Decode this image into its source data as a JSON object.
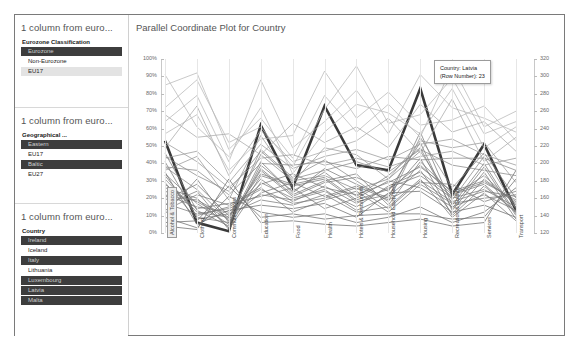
{
  "filters": [
    {
      "title": "1 column from euro...",
      "field": "Eurozone Classification",
      "options": [
        {
          "label": "Eurozone",
          "state": "selected"
        },
        {
          "label": "Non-Eurozone",
          "state": "normal"
        },
        {
          "label": "EU17",
          "state": "band"
        }
      ]
    },
    {
      "title": "1 column from euro...",
      "field": "Geographical ...",
      "options": [
        {
          "label": "Eastern",
          "state": "selected"
        },
        {
          "label": "EU17",
          "state": "normal"
        },
        {
          "label": "Baltic",
          "state": "selected"
        },
        {
          "label": "EU27",
          "state": "normal"
        }
      ]
    },
    {
      "title": "1 column from euro...",
      "field": "Country",
      "options": [
        {
          "label": "Ireland",
          "state": "selected"
        },
        {
          "label": "Iceland",
          "state": "normal"
        },
        {
          "label": "Italy",
          "state": "selected"
        },
        {
          "label": "Lithuania",
          "state": "normal"
        },
        {
          "label": "Luxembourg",
          "state": "selected"
        },
        {
          "label": "Latvia",
          "state": "selected"
        },
        {
          "label": "Malta",
          "state": "selected"
        }
      ]
    }
  ],
  "chart_panel": {
    "title": "Parallel Coordinate Plot for Country"
  },
  "tooltip": {
    "line1": "Country: Latvia",
    "line2": "(Row Number): 23"
  },
  "chart_data": {
    "type": "line",
    "title": "Parallel Coordinate Plot for Country",
    "xlabel": "",
    "ylabel": "",
    "grid": false,
    "legend_position": "none",
    "categories": [
      "Alcohol & Tobacco",
      "Clothing",
      "Communications",
      "Education",
      "Food",
      "Health",
      "Hotels & Restaurants",
      "Household Equipment",
      "Housing",
      "Recreation & Culture",
      "Services",
      "Transport"
    ],
    "selected_category": "Alcohol & Tobacco",
    "left_axis": {
      "ticks": [
        "0%",
        "10%",
        "20%",
        "30%",
        "40%",
        "50%",
        "60%",
        "70%",
        "80%",
        "90%",
        "100%"
      ],
      "values": [
        0,
        10,
        20,
        30,
        40,
        50,
        60,
        70,
        80,
        90,
        100
      ],
      "ylim": [
        0,
        100
      ]
    },
    "right_axis": {
      "ticks": [
        "120",
        "140",
        "160",
        "180",
        "200",
        "220",
        "240",
        "260",
        "280",
        "300",
        "320"
      ],
      "values": [
        120,
        140,
        160,
        180,
        200,
        220,
        240,
        260,
        280,
        300,
        320
      ],
      "ylim": [
        120,
        320
      ]
    },
    "highlighted_series": "Latvia",
    "series": [
      {
        "name": "Latvia",
        "highlight": true,
        "values": [
          53,
          6,
          1,
          62,
          26,
          73,
          39,
          36,
          83,
          22,
          51,
          13
        ]
      },
      {
        "name": "Lithuania",
        "highlight": false,
        "values": [
          34,
          17,
          5,
          41,
          23,
          37,
          28,
          20,
          58,
          16,
          40,
          11
        ]
      },
      {
        "name": "Estonia",
        "highlight": false,
        "values": [
          31,
          12,
          9,
          45,
          30,
          33,
          25,
          31,
          47,
          19,
          44,
          14
        ]
      },
      {
        "name": "Ireland",
        "highlight": false,
        "values": [
          41,
          9,
          6,
          36,
          21,
          29,
          32,
          24,
          52,
          13,
          35,
          8
        ]
      },
      {
        "name": "Italy",
        "highlight": false,
        "values": [
          22,
          15,
          12,
          28,
          34,
          26,
          22,
          29,
          38,
          24,
          30,
          18
        ]
      },
      {
        "name": "Malta",
        "highlight": false,
        "values": [
          26,
          20,
          3,
          33,
          27,
          31,
          18,
          22,
          43,
          10,
          27,
          12
        ]
      },
      {
        "name": "Luxembourg",
        "highlight": false,
        "values": [
          17,
          11,
          14,
          22,
          19,
          24,
          15,
          27,
          35,
          21,
          33,
          16
        ]
      },
      {
        "name": "Iceland",
        "highlight": false,
        "values": [
          38,
          25,
          7,
          48,
          32,
          42,
          30,
          18,
          55,
          26,
          46,
          20
        ]
      },
      {
        "name": "Bulgaria",
        "highlight": false,
        "values": [
          29,
          8,
          11,
          19,
          16,
          22,
          12,
          15,
          31,
          9,
          23,
          7
        ]
      },
      {
        "name": "Romania",
        "highlight": false,
        "values": [
          13,
          22,
          16,
          26,
          12,
          19,
          24,
          12,
          28,
          17,
          20,
          22
        ]
      },
      {
        "name": "Poland",
        "highlight": false,
        "values": [
          46,
          13,
          4,
          39,
          24,
          35,
          21,
          33,
          49,
          14,
          38,
          10
        ]
      },
      {
        "name": "Hungary",
        "highlight": false,
        "values": [
          19,
          28,
          10,
          31,
          18,
          27,
          17,
          26,
          33,
          20,
          25,
          15
        ]
      },
      {
        "name": "Czech Republic",
        "highlight": false,
        "values": [
          24,
          18,
          8,
          23,
          29,
          21,
          27,
          19,
          29,
          28,
          18,
          24
        ]
      },
      {
        "name": "Slovakia",
        "highlight": false,
        "values": [
          35,
          5,
          13,
          16,
          14,
          17,
          9,
          23,
          24,
          12,
          16,
          9
        ]
      },
      {
        "name": "Slovenia",
        "highlight": false,
        "values": [
          11,
          31,
          6,
          37,
          22,
          30,
          34,
          16,
          41,
          23,
          29,
          19
        ]
      },
      {
        "name": "Croatia",
        "highlight": false,
        "values": [
          28,
          14,
          17,
          21,
          26,
          14,
          20,
          30,
          26,
          15,
          22,
          13
        ]
      },
      {
        "name": "Greece",
        "highlight": false,
        "values": [
          16,
          24,
          2,
          29,
          20,
          25,
          13,
          21,
          36,
          11,
          31,
          17
        ]
      },
      {
        "name": "Portugal",
        "highlight": false,
        "values": [
          33,
          10,
          15,
          25,
          17,
          20,
          26,
          14,
          30,
          18,
          24,
          21
        ]
      },
      {
        "name": "Spain",
        "highlight": false,
        "values": [
          21,
          19,
          9,
          34,
          28,
          32,
          19,
          25,
          39,
          22,
          28,
          12
        ]
      },
      {
        "name": "Cyprus",
        "highlight": false,
        "values": [
          85,
          92,
          48,
          66,
          43,
          79,
          58,
          74,
          55,
          96,
          61,
          70
        ]
      },
      {
        "name": "Norway",
        "highlight": false,
        "values": [
          72,
          88,
          52,
          61,
          38,
          71,
          96,
          63,
          68,
          89,
          57,
          64
        ]
      },
      {
        "name": "Switzerland",
        "highlight": false,
        "values": [
          64,
          79,
          41,
          88,
          49,
          64,
          82,
          57,
          91,
          72,
          66,
          58
        ]
      },
      {
        "name": "Sweden",
        "highlight": false,
        "values": [
          57,
          68,
          36,
          54,
          56,
          93,
          66,
          81,
          62,
          65,
          73,
          53
        ]
      },
      {
        "name": "Denmark",
        "highlight": false,
        "values": [
          91,
          61,
          44,
          72,
          34,
          58,
          74,
          69,
          57,
          83,
          49,
          61
        ]
      },
      {
        "name": "Finland",
        "highlight": false,
        "values": [
          68,
          55,
          57,
          45,
          63,
          52,
          61,
          49,
          74,
          58,
          64,
          47
        ]
      },
      {
        "name": "Netherlands",
        "highlight": false,
        "values": [
          49,
          73,
          33,
          59,
          41,
          47,
          53,
          66,
          46,
          77,
          41,
          55
        ]
      },
      {
        "name": "Belgium",
        "highlight": false,
        "values": [
          43,
          47,
          29,
          51,
          37,
          44,
          48,
          42,
          51,
          54,
          45,
          39
        ]
      },
      {
        "name": "Austria",
        "highlight": false,
        "values": [
          52,
          41,
          26,
          43,
          45,
          39,
          43,
          38,
          44,
          47,
          39,
          43
        ]
      },
      {
        "name": "Germany",
        "highlight": false,
        "values": [
          38,
          36,
          22,
          40,
          39,
          41,
          37,
          44,
          42,
          43,
          43,
          36
        ]
      },
      {
        "name": "France",
        "highlight": false,
        "values": [
          44,
          33,
          24,
          47,
          31,
          36,
          41,
          35,
          48,
          39,
          36,
          33
        ]
      },
      {
        "name": "United Kingdom",
        "highlight": false,
        "values": [
          36,
          44,
          19,
          56,
          29,
          49,
          45,
          31,
          53,
          49,
          52,
          29
        ]
      },
      {
        "name": "Turkey",
        "highlight": false,
        "values": [
          9,
          3,
          21,
          12,
          9,
          11,
          6,
          9,
          15,
          6,
          12,
          26
        ]
      },
      {
        "name": "Serbia",
        "highlight": false,
        "values": [
          6,
          7,
          27,
          9,
          11,
          8,
          10,
          11,
          11,
          8,
          9,
          31
        ]
      },
      {
        "name": "Macedonia",
        "highlight": false,
        "values": [
          4,
          2,
          31,
          6,
          7,
          5,
          4,
          6,
          8,
          4,
          6,
          36
        ]
      }
    ]
  }
}
